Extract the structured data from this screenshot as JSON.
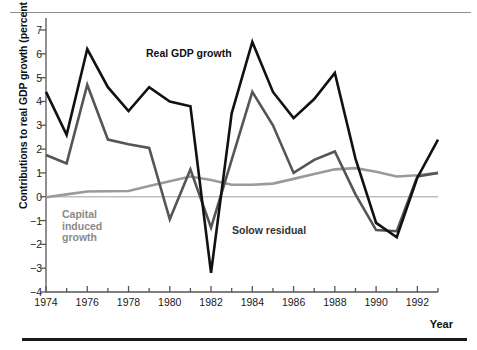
{
  "figure": {
    "ylabel": "Contributions to real GDP growth (percent per year)",
    "xlabel": "Year"
  },
  "annotations": {
    "real_gdp": "Real GDP growth",
    "solow": "Solow residual",
    "capital_line1": "Capital",
    "capital_line2": "induced",
    "capital_line3": "growth"
  },
  "colors": {
    "real_gdp": "#111111",
    "solow": "#555555",
    "capital": "#9a9a9a",
    "zero_line": "#bdbdbd",
    "axis": "#555555",
    "top_rule": "#8e8e8e",
    "bottom_rule": "#1a1a1a"
  },
  "chart_data": {
    "type": "line",
    "title": "",
    "xlabel": "Year",
    "ylabel": "Contributions to real GDP growth (percent per year)",
    "xlim": [
      1974,
      1993
    ],
    "ylim": [
      -4,
      7
    ],
    "grid": false,
    "legend": "inline-annotations",
    "yticks": [
      7,
      6,
      5,
      4,
      3,
      2,
      1,
      0,
      -1,
      -2,
      -3,
      -4
    ],
    "xticks": [
      1974,
      1976,
      1978,
      1980,
      1982,
      1984,
      1986,
      1988,
      1990,
      1992
    ],
    "xticks_minor": [
      1975,
      1977,
      1979,
      1981,
      1983,
      1985,
      1987,
      1989,
      1991,
      1993
    ],
    "x": [
      1974,
      1975,
      1976,
      1977,
      1978,
      1979,
      1980,
      1981,
      1982,
      1983,
      1984,
      1985,
      1986,
      1987,
      1988,
      1989,
      1990,
      1991,
      1992,
      1993
    ],
    "series": [
      {
        "name": "Real GDP growth",
        "color": "#111111",
        "width": 2.6,
        "values": [
          4.4,
          2.6,
          6.2,
          4.6,
          3.6,
          4.6,
          4.0,
          3.8,
          -3.2,
          3.5,
          6.5,
          4.4,
          3.3,
          4.1,
          5.2,
          1.6,
          -1.1,
          -1.7,
          0.8,
          2.4
        ]
      },
      {
        "name": "Solow residual",
        "color": "#555555",
        "width": 2.6,
        "values": [
          1.75,
          1.4,
          4.7,
          2.4,
          2.2,
          2.05,
          -0.95,
          1.15,
          -1.3,
          1.55,
          4.4,
          3.0,
          1.0,
          1.55,
          1.9,
          0.1,
          -1.4,
          -1.45,
          0.85,
          1.0
        ]
      },
      {
        "name": "Capital induced growth",
        "color": "#9a9a9a",
        "width": 2.6,
        "values": [
          -0.02,
          0.1,
          0.22,
          0.23,
          0.24,
          0.45,
          0.65,
          0.85,
          0.7,
          0.5,
          0.5,
          0.55,
          0.75,
          0.95,
          1.15,
          1.2,
          1.05,
          0.85,
          0.9,
          1.0
        ]
      }
    ],
    "reference_lines": [
      {
        "name": "zero",
        "y": 0,
        "color": "#bdbdbd",
        "width": 1.6
      }
    ]
  }
}
